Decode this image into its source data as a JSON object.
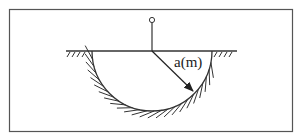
{
  "diagram": {
    "radius_label": "a(m)",
    "elements": [
      "frame",
      "ground-line",
      "electrode-post",
      "hemispherical-electrode",
      "radius-arrow"
    ],
    "colors": {
      "stroke": "#333333",
      "background": "#ffffff"
    }
  }
}
